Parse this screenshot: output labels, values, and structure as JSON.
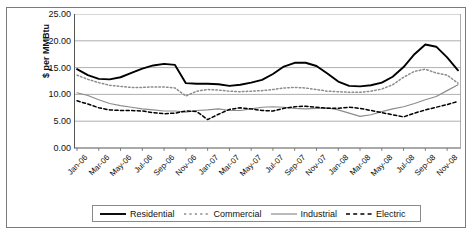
{
  "axes": {
    "ylabel": "$ per MMBtu",
    "yticks": [
      "0.00",
      "5.00",
      "10.00",
      "15.00",
      "20.00",
      "25.00"
    ]
  },
  "legend": {
    "items": [
      {
        "label": "Residential",
        "style": "solid-thick-black",
        "color": "#000000"
      },
      {
        "label": "Commercial",
        "style": "dotted-gray",
        "color": "#8c8c8c"
      },
      {
        "label": "Industrial",
        "style": "solid-gray",
        "color": "#8c8c8c"
      },
      {
        "label": "Electric",
        "style": "dashed-black",
        "color": "#000000"
      }
    ]
  },
  "chart_data": {
    "type": "line",
    "title": "",
    "xlabel": "",
    "ylabel": "$ per MMBtu",
    "ylim": [
      0,
      25
    ],
    "ytick_step": 5,
    "grid": true,
    "legend_position": "bottom",
    "x": [
      "Jan-06",
      "Feb-06",
      "Mar-06",
      "Apr-06",
      "May-06",
      "Jun-06",
      "Jul-06",
      "Aug-06",
      "Sep-06",
      "Oct-06",
      "Nov-06",
      "Dec-06",
      "Jan-07",
      "Feb-07",
      "Mar-07",
      "Apr-07",
      "May-07",
      "Jun-07",
      "Jul-07",
      "Aug-07",
      "Sep-07",
      "Oct-07",
      "Nov-07",
      "Dec-07",
      "Jan-08",
      "Feb-08",
      "Mar-08",
      "Apr-08",
      "May-08",
      "Jun-08",
      "Jul-08",
      "Aug-08",
      "Sep-08",
      "Oct-08",
      "Nov-08",
      "Dec-08"
    ],
    "xtick_labels": [
      "Jan-06",
      "Mar-06",
      "May-06",
      "Jul-06",
      "Sep-06",
      "Nov-06",
      "Jan-07",
      "Mar-07",
      "May-07",
      "Jul-07",
      "Sep-07",
      "Nov-07",
      "Jan-08",
      "Mar-08",
      "May-08",
      "Jul-08",
      "Sep-08",
      "Nov-08"
    ],
    "xtick_indices": [
      0,
      2,
      4,
      6,
      8,
      10,
      12,
      14,
      16,
      18,
      20,
      22,
      24,
      26,
      28,
      30,
      32,
      34
    ],
    "series": [
      {
        "name": "Residential",
        "color": "#000000",
        "values": [
          14.7,
          13.6,
          12.9,
          12.8,
          13.2,
          14.0,
          14.8,
          15.4,
          15.7,
          15.5,
          12.1,
          12.0,
          12.0,
          11.9,
          11.6,
          11.8,
          12.2,
          12.7,
          13.8,
          15.2,
          15.9,
          15.9,
          15.3,
          13.9,
          12.4,
          11.6,
          11.5,
          11.7,
          12.2,
          13.3,
          15.1,
          17.5,
          19.3,
          18.9,
          16.9,
          14.5
        ]
      },
      {
        "name": "Commercial",
        "color": "#8c8c8c",
        "values": [
          13.6,
          12.8,
          12.2,
          11.7,
          11.5,
          11.3,
          11.3,
          11.4,
          11.4,
          11.2,
          9.7,
          10.6,
          10.9,
          10.8,
          10.6,
          10.5,
          10.6,
          10.7,
          10.9,
          11.2,
          11.3,
          11.2,
          10.9,
          10.6,
          10.5,
          10.4,
          10.4,
          10.6,
          11.0,
          11.8,
          13.2,
          14.3,
          14.7,
          14.0,
          13.6,
          12.1
        ]
      },
      {
        "name": "Industrial",
        "color": "#8c8c8c",
        "values": [
          10.3,
          9.8,
          9.0,
          8.3,
          7.9,
          7.6,
          7.3,
          7.1,
          6.9,
          6.9,
          6.7,
          7.0,
          7.1,
          7.3,
          7.0,
          7.0,
          7.3,
          7.6,
          7.7,
          7.6,
          7.4,
          7.3,
          7.4,
          7.5,
          7.1,
          6.5,
          5.9,
          6.2,
          6.8,
          7.3,
          7.7,
          8.3,
          9.0,
          9.6,
          10.7,
          11.8
        ]
      },
      {
        "name": "Electric",
        "color": "#000000",
        "values": [
          8.8,
          8.2,
          7.5,
          7.1,
          7.0,
          7.0,
          6.9,
          6.6,
          6.4,
          6.5,
          6.9,
          6.8,
          5.3,
          6.3,
          7.2,
          7.5,
          7.3,
          7.0,
          6.9,
          7.4,
          7.7,
          7.8,
          7.6,
          7.4,
          7.4,
          7.6,
          7.4,
          7.0,
          6.6,
          6.2,
          5.8,
          6.5,
          7.1,
          7.6,
          8.1,
          8.7
        ]
      }
    ],
    "note_series_secondary": [
      {
        "name": "Industrial-tail",
        "values": [
          11.8,
          12.2,
          9.7,
          8.4,
          7.0,
          7.2
        ]
      },
      {
        "name": "Electric-tail",
        "values": [
          9.4,
          12.2,
          10.4,
          8.1,
          6.5,
          6.3
        ]
      }
    ]
  }
}
